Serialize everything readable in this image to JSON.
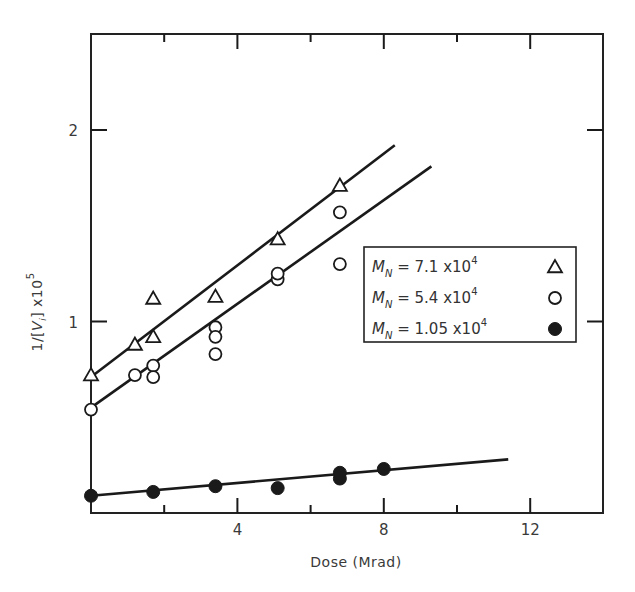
{
  "chart_data": {
    "type": "scatter",
    "title": "",
    "xlabel": "Dose (Mrad)",
    "ylabel": "1/[V_i] x10^5",
    "ylabel_parts": {
      "prefix": "1/[",
      "var": "V",
      "sub": "i",
      "suffix": "] x10",
      "sup": "5"
    },
    "xlim": [
      0,
      14
    ],
    "ylim": [
      0,
      2.5
    ],
    "x_ticks": [
      0,
      2,
      4,
      6,
      8,
      10,
      12
    ],
    "x_tick_labels": [
      {
        "value": 4,
        "label": "4"
      },
      {
        "value": 8,
        "label": "8"
      },
      {
        "value": 12,
        "label": "12"
      }
    ],
    "y_ticks": [
      1,
      2
    ],
    "y_tick_labels": [
      {
        "value": 1,
        "label": "1"
      },
      {
        "value": 2,
        "label": "2"
      }
    ],
    "grid": false,
    "legend_position": "right-center (inside plot)",
    "series": [
      {
        "name": "M_N = 7.1 x10^4",
        "legend": {
          "label": "M",
          "sub": "N",
          "eq": " = 7.1 x10",
          "sup": "4"
        },
        "marker": "triangle-open",
        "points": [
          [
            0,
            0.72
          ],
          [
            1.2,
            0.88
          ],
          [
            1.7,
            1.12
          ],
          [
            1.7,
            0.92
          ],
          [
            3.4,
            1.13
          ],
          [
            5.1,
            1.43
          ],
          [
            6.8,
            1.71
          ]
        ],
        "fit_line": [
          [
            0,
            0.71
          ],
          [
            8.3,
            1.92
          ]
        ]
      },
      {
        "name": "M_N = 5.4 x10^4",
        "legend": {
          "label": "M",
          "sub": "N",
          "eq": " = 5.4 x10",
          "sup": "4"
        },
        "marker": "circle-open",
        "points": [
          [
            0,
            0.54
          ],
          [
            1.2,
            0.72
          ],
          [
            1.7,
            0.77
          ],
          [
            1.7,
            0.71
          ],
          [
            3.4,
            0.97
          ],
          [
            3.4,
            0.92
          ],
          [
            3.4,
            0.83
          ],
          [
            5.1,
            1.22
          ],
          [
            5.1,
            1.25
          ],
          [
            6.8,
            1.57
          ],
          [
            6.8,
            1.3
          ]
        ],
        "fit_line": [
          [
            0,
            0.55
          ],
          [
            9.3,
            1.81
          ]
        ]
      },
      {
        "name": "M_N = 1.05 x10^4",
        "legend": {
          "label": "M",
          "sub": "N",
          "eq": " = 1.05 x10",
          "sup": "4"
        },
        "marker": "circle-filled",
        "points": [
          [
            0,
            0.09
          ],
          [
            1.7,
            0.11
          ],
          [
            3.4,
            0.14
          ],
          [
            5.1,
            0.13
          ],
          [
            6.8,
            0.18
          ],
          [
            6.8,
            0.21
          ],
          [
            8.0,
            0.23
          ]
        ],
        "fit_line": [
          [
            0,
            0.09
          ],
          [
            11.4,
            0.28
          ]
        ]
      }
    ]
  },
  "colors": {
    "ink": "#1a1a1a",
    "text": "#3a3a3a",
    "background": "#ffffff"
  }
}
